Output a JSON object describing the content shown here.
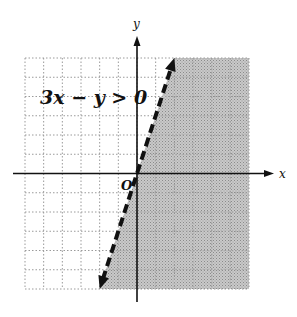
{
  "chart_data": {
    "type": "line",
    "title": "",
    "inequality_label": "3x − y > 0",
    "boundary": {
      "equation": "y = 3x",
      "style": "dashed",
      "points": [
        [
          -2,
          -6
        ],
        [
          2,
          6
        ]
      ]
    },
    "shaded_region": "right/below of y = 3x (3x − y > 0)",
    "xlabel": "x",
    "ylabel": "y",
    "origin_label": "O",
    "xlim": [
      -6,
      6
    ],
    "ylim": [
      -6,
      6
    ],
    "grid": true,
    "grid_step": 1,
    "colors": {
      "shade": "#b8b8b8",
      "grid": "#9a9a9a",
      "axis": "#111111",
      "line": "#111111"
    }
  },
  "labels": {
    "inequality": "3x − y > 0",
    "x_axis": "x",
    "y_axis": "y",
    "origin": "O"
  }
}
